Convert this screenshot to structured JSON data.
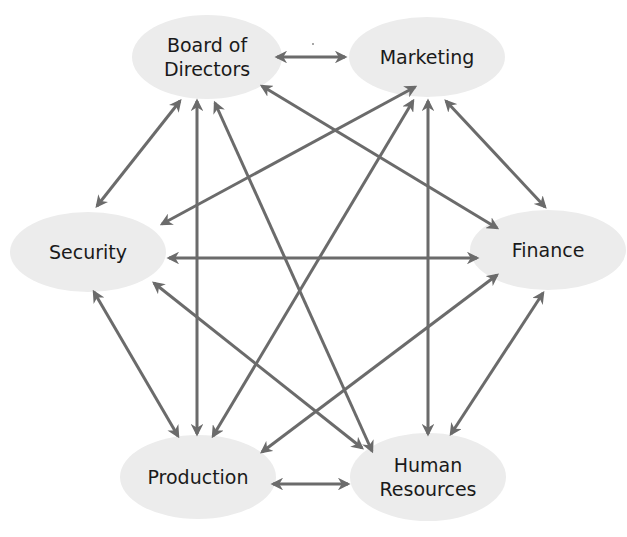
{
  "diagram": {
    "type": "fully-connected-network",
    "colors": {
      "background": "#ffffff",
      "node_fill": "#ececec",
      "edge": "#6b6b6b",
      "text": "#1a1a1a"
    },
    "nodes": [
      {
        "id": "board",
        "label_lines": [
          "Board of",
          "Directors"
        ],
        "cx": 207,
        "cy": 57,
        "rx": 75,
        "ry": 42
      },
      {
        "id": "marketing",
        "label_lines": [
          "Marketing"
        ],
        "cx": 427,
        "cy": 57,
        "rx": 78,
        "ry": 40
      },
      {
        "id": "security",
        "label_lines": [
          "Security"
        ],
        "cx": 88,
        "cy": 252,
        "rx": 78,
        "ry": 40
      },
      {
        "id": "finance",
        "label_lines": [
          "Finance"
        ],
        "cx": 548,
        "cy": 250,
        "rx": 78,
        "ry": 40
      },
      {
        "id": "production",
        "label_lines": [
          "Production"
        ],
        "cx": 198,
        "cy": 477,
        "rx": 78,
        "ry": 42
      },
      {
        "id": "hr",
        "label_lines": [
          "Human",
          "Resources"
        ],
        "cx": 428,
        "cy": 477,
        "rx": 78,
        "ry": 44
      }
    ],
    "edges": [
      {
        "from": "board",
        "to": "marketing",
        "direction": "both",
        "x1": 277,
        "y1": 57,
        "x2": 345,
        "y2": 57
      },
      {
        "from": "board",
        "to": "security",
        "direction": "both",
        "x1": 180,
        "y1": 101,
        "x2": 97,
        "y2": 206
      },
      {
        "from": "board",
        "to": "production",
        "direction": "both",
        "x1": 197,
        "y1": 101,
        "x2": 197,
        "y2": 434
      },
      {
        "from": "board",
        "to": "hr",
        "direction": "both",
        "x1": 215,
        "y1": 103,
        "x2": 372,
        "y2": 451
      },
      {
        "from": "board",
        "to": "finance",
        "direction": "both",
        "x1": 262,
        "y1": 86,
        "x2": 497,
        "y2": 228
      },
      {
        "from": "marketing",
        "to": "security",
        "direction": "both",
        "x1": 415,
        "y1": 87,
        "x2": 162,
        "y2": 224
      },
      {
        "from": "marketing",
        "to": "production",
        "direction": "both",
        "x1": 413,
        "y1": 101,
        "x2": 213,
        "y2": 436
      },
      {
        "from": "marketing",
        "to": "hr",
        "direction": "both",
        "x1": 428,
        "y1": 101,
        "x2": 428,
        "y2": 434
      },
      {
        "from": "marketing",
        "to": "finance",
        "direction": "both",
        "x1": 446,
        "y1": 101,
        "x2": 545,
        "y2": 207
      },
      {
        "from": "security",
        "to": "finance",
        "direction": "both",
        "x1": 169,
        "y1": 258,
        "x2": 477,
        "y2": 258
      },
      {
        "from": "security",
        "to": "production",
        "direction": "both",
        "x1": 94,
        "y1": 292,
        "x2": 178,
        "y2": 436
      },
      {
        "from": "security",
        "to": "hr",
        "direction": "both",
        "x1": 154,
        "y1": 283,
        "x2": 362,
        "y2": 448
      },
      {
        "from": "finance",
        "to": "production",
        "direction": "both",
        "x1": 497,
        "y1": 275,
        "x2": 262,
        "y2": 452
      },
      {
        "from": "finance",
        "to": "hr",
        "direction": "both",
        "x1": 543,
        "y1": 293,
        "x2": 451,
        "y2": 434
      },
      {
        "from": "production",
        "to": "hr",
        "direction": "both",
        "x1": 273,
        "y1": 484,
        "x2": 348,
        "y2": 484
      }
    ]
  }
}
